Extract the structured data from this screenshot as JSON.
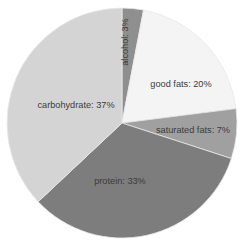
{
  "chart_data": {
    "type": "pie",
    "title": "",
    "subtitle": "",
    "xlabel": "",
    "ylabel": "",
    "grid": false,
    "legend_position": "none",
    "labels_inside_slices": true,
    "total": 100,
    "units": "%",
    "start_angle_deg": 0,
    "direction": "clockwise",
    "categories": [
      "alcohol",
      "good fats",
      "saturated fats",
      "protein",
      "carbohydrate"
    ],
    "values": [
      3,
      20,
      7,
      33,
      37
    ],
    "slices": [
      {
        "name": "alcohol",
        "value": 3,
        "label": "alcohol: 3%",
        "color": "#8f8f8f",
        "label_rotation_deg": -90,
        "label_x": 126,
        "label_y": 42,
        "label_anchor": "middle"
      },
      {
        "name": "good fats",
        "value": 20,
        "label": "good fats: 20%",
        "color": "#f4f4f4",
        "label_rotation_deg": 0,
        "label_x": 181,
        "label_y": 85,
        "label_anchor": "middle"
      },
      {
        "name": "saturated fats",
        "value": 7,
        "label": "saturated fats: 7%",
        "color": "#a0a0a0",
        "label_rotation_deg": 0,
        "label_x": 193,
        "label_y": 131,
        "label_anchor": "middle"
      },
      {
        "name": "protein",
        "value": 33,
        "label": "protein: 33%",
        "color": "#7d7d7d",
        "label_rotation_deg": 0,
        "label_x": 120,
        "label_y": 182,
        "label_anchor": "middle"
      },
      {
        "name": "carbohydrate",
        "value": 37,
        "label": "carbohydrate: 37%",
        "color": "#d4d4d4",
        "label_rotation_deg": 0,
        "label_x": 76,
        "label_y": 106,
        "label_anchor": "middle"
      }
    ],
    "geometry": {
      "center_x": 122,
      "center_y": 123,
      "radius": 115
    },
    "colors": {
      "background": "#ffffff",
      "slice_border": "#e8e8e8",
      "label_text": "#3c3c3c"
    }
  }
}
